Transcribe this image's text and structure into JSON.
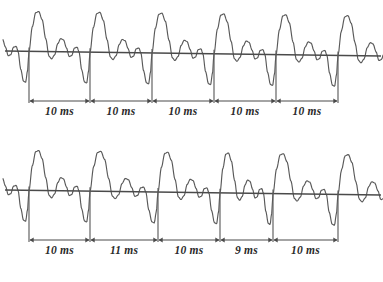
{
  "figure": {
    "title": "",
    "background_color": "#ffffff",
    "stroke_color": "#595959",
    "axis_color": "#4a4a4a",
    "label_color": "#2b2b2b",
    "width": 383,
    "height": 282
  },
  "chart_data": {
    "type": "line",
    "title": "",
    "subtitle": "",
    "xlabel": "",
    "ylabel": "",
    "grid": false,
    "legend_position": "none",
    "panels": [
      {
        "name": "regular-rhythm",
        "baseline_label": "",
        "intervals": [
          {
            "index": 1,
            "label": "10 ms",
            "value": 10,
            "unit": "ms",
            "start_x": 29,
            "end_x": 90
          },
          {
            "index": 2,
            "label": "10 ms",
            "value": 10,
            "unit": "ms",
            "start_x": 90,
            "end_x": 152
          },
          {
            "index": 3,
            "label": "10 ms",
            "value": 10,
            "unit": "ms",
            "start_x": 152,
            "end_x": 214
          },
          {
            "index": 4,
            "label": "10 ms",
            "value": 10,
            "unit": "ms",
            "start_x": 214,
            "end_x": 276
          },
          {
            "index": 5,
            "label": "10 ms",
            "value": 10,
            "unit": "ms",
            "start_x": 276,
            "end_x": 338
          }
        ],
        "marker_positions": [
          29,
          90,
          152,
          214,
          276,
          338
        ],
        "total_ms": 50
      },
      {
        "name": "irregular-rhythm",
        "baseline_label": "",
        "intervals": [
          {
            "index": 1,
            "label": "10 ms",
            "value": 10,
            "unit": "ms",
            "start_x": 29,
            "end_x": 90
          },
          {
            "index": 2,
            "label": "11 ms",
            "value": 11,
            "unit": "ms",
            "start_x": 90,
            "end_x": 158
          },
          {
            "index": 3,
            "label": "10 ms",
            "value": 10,
            "unit": "ms",
            "start_x": 158,
            "end_x": 220
          },
          {
            "index": 4,
            "label": "9 ms",
            "value": 9,
            "unit": "ms",
            "start_x": 220,
            "end_x": 273
          },
          {
            "index": 5,
            "label": "10 ms",
            "value": 10,
            "unit": "ms",
            "start_x": 273,
            "end_x": 338
          }
        ],
        "marker_positions": [
          29,
          90,
          158,
          220,
          273,
          338
        ],
        "total_ms": 50
      }
    ]
  }
}
